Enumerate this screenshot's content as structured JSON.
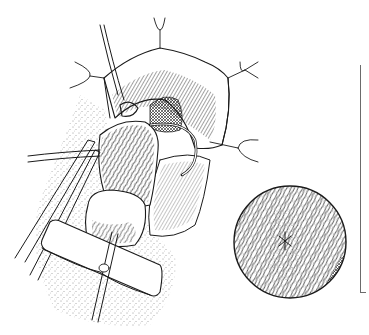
{
  "figure": {
    "type": "surgical line illustration",
    "style": "black ink on white, stippled shading",
    "colors": {
      "ink": "#1a1a1a",
      "background": "#ffffff",
      "scale_bar": "#6b6b6b"
    },
    "elements": [
      {
        "id": "retracted-incision",
        "label": "Opened tissue with four traction sutures"
      },
      {
        "id": "bundled-tissue",
        "label": "Fibrous tissue bundle held at base"
      },
      {
        "id": "curved-needle",
        "label": "Curved suture needle"
      },
      {
        "id": "forceps",
        "label": "Forceps entering from left"
      },
      {
        "id": "gauze-pad",
        "label": "Rectangular pad with catheter tube"
      },
      {
        "id": "magnified-inset",
        "label": "Circular magnified view of fibers with central knot"
      },
      {
        "id": "scale-bracket",
        "label": "Vertical bracket line at right edge"
      }
    ],
    "inset": {
      "cx": 290,
      "cy": 242,
      "r": 56
    },
    "scale_bar": {
      "x": 360,
      "y_top": 65,
      "y_bottom": 293
    }
  }
}
